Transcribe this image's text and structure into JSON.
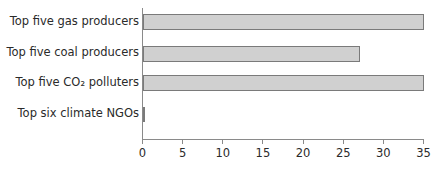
{
  "chart_data": {
    "type": "bar",
    "orientation": "horizontal",
    "title": "",
    "xlabel": "",
    "ylabel": "",
    "categories": [
      "Top five gas producers",
      "Top five coal producers",
      "Top five CO₂ polluters",
      "Top six climate NGOs"
    ],
    "values": [
      35,
      27,
      35,
      0.2
    ],
    "xlim": [
      0,
      35
    ],
    "xticks": [
      "0",
      "5",
      "10",
      "15",
      "20",
      "25",
      "30",
      "35"
    ],
    "grid": false,
    "legend": null,
    "bar_color": "#d0d0d0",
    "bar_edge_color": "#7a7a7a"
  }
}
